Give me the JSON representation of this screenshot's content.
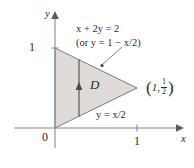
{
  "figure": {
    "background_color": "#ffffff",
    "axis_color": "#8a8a8a",
    "region_fill_color": "#dedbd8",
    "region_stroke_color": "#6e6e6e",
    "text_color": "#2b2b2b"
  },
  "axes": {
    "x_label": "x",
    "y_label": "y",
    "origin_label": "0",
    "x_ticks": [
      {
        "label": "1",
        "value": 1
      }
    ],
    "y_ticks": [
      {
        "label": "1",
        "value": 1
      }
    ],
    "x_range": [
      -0.45,
      1.45
    ],
    "y_range": [
      -0.3,
      1.35
    ]
  },
  "region": {
    "name": "D",
    "label": "D",
    "vertices": [
      {
        "x": 0,
        "y": 1
      },
      {
        "x": 0,
        "y": 0
      },
      {
        "x": 1,
        "y": 0.5
      }
    ]
  },
  "annotations": {
    "upper_boundary": {
      "line1_pre": "x",
      "line1_mid": " + 2",
      "line1_var": "y",
      "line1_post": " = 2",
      "line1_full": "x + 2y = 2",
      "line2_full": "(or y = 1 − x/2)",
      "line2_pre": "(or ",
      "line2_var": "y",
      "line2_mid": " = 1 − ",
      "line2_var2": "x",
      "line2_post": "/2)"
    },
    "lower_boundary": {
      "full": "y = x/2",
      "var_y": "y",
      "mid": " = ",
      "var_x": "x",
      "post": "/2"
    },
    "vertex_point": {
      "full": "(1, 1/2)",
      "x_value": "1",
      "comma": ",",
      "frac_numerator": "1",
      "frac_denominator": "2",
      "open_paren": "(",
      "close_paren": ")"
    }
  }
}
